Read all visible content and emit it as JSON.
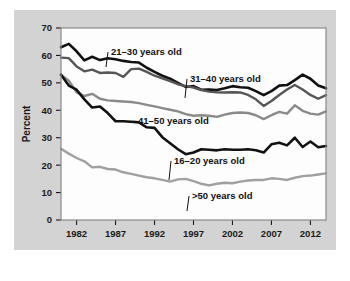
{
  "chart_data": {
    "type": "line",
    "title": "",
    "xlabel": "",
    "ylabel": "Percent",
    "xlim": [
      1980,
      2014
    ],
    "ylim": [
      0,
      70
    ],
    "ytick_values": [
      0,
      10,
      20,
      30,
      40,
      50,
      60,
      70
    ],
    "ytick_labels": [
      "0",
      "10",
      "20",
      "30",
      "40",
      "50",
      "60",
      "70"
    ],
    "xtick_values": [
      1982,
      1987,
      1992,
      1997,
      2002,
      2007,
      2012
    ],
    "xtick_labels": [
      "1982",
      "1987",
      "1992",
      "1997",
      "2002",
      "2007",
      "2012"
    ],
    "grid": false,
    "legend_position": "inline-annotations",
    "x": [
      1980,
      1981,
      1982,
      1983,
      1984,
      1985,
      1986,
      1987,
      1988,
      1989,
      1990,
      1991,
      1992,
      1993,
      1994,
      1995,
      1996,
      1997,
      1998,
      1999,
      2000,
      2001,
      2002,
      2003,
      2004,
      2005,
      2006,
      2007,
      2008,
      2009,
      2010,
      2011,
      2012,
      2013,
      2014
    ],
    "series": [
      {
        "name": "21-30 years old",
        "label": "21–30 years old",
        "color": "#111111",
        "width": 2.6,
        "values": [
          63.0,
          64.2,
          61.5,
          58.2,
          59.5,
          58.3,
          59.0,
          58.6,
          58.0,
          57.6,
          57.4,
          55.5,
          54.0,
          52.6,
          51.5,
          50.0,
          48.5,
          48.8,
          47.5,
          47.6,
          47.4,
          48.0,
          48.8,
          48.4,
          48.2,
          47.0,
          45.5,
          47.0,
          49.0,
          49.2,
          51.0,
          53.0,
          51.5,
          49.0,
          48.0
        ]
      },
      {
        "name": "31-40 years old",
        "label": "31–40 years old",
        "color": "#565656",
        "width": 2.4,
        "values": [
          59.2,
          59.0,
          56.0,
          54.2,
          54.8,
          53.6,
          53.8,
          53.6,
          52.2,
          55.0,
          55.2,
          54.0,
          52.6,
          51.6,
          50.6,
          49.5,
          48.8,
          48.3,
          47.4,
          46.8,
          46.6,
          46.5,
          46.6,
          46.5,
          45.6,
          44.0,
          41.6,
          43.4,
          45.6,
          47.6,
          49.2,
          47.6,
          45.6,
          44.2,
          45.5
        ]
      },
      {
        "name": "41-50 years old",
        "label": "41–50 years old",
        "color": "#8a8a8a",
        "width": 2.4,
        "values": [
          53.0,
          50.8,
          46.5,
          45.2,
          46.0,
          44.2,
          43.6,
          43.4,
          43.2,
          43.0,
          42.6,
          42.0,
          41.4,
          40.8,
          40.2,
          39.6,
          38.6,
          38.0,
          38.2,
          38.0,
          37.6,
          38.4,
          39.0,
          39.2,
          39.0,
          38.2,
          36.8,
          38.2,
          39.4,
          38.8,
          41.8,
          39.8,
          38.8,
          38.4,
          39.6
        ]
      },
      {
        "name": "16-20 years old",
        "label": "16–20 years old",
        "color": "#111111",
        "width": 2.6,
        "values": [
          53.0,
          49.0,
          47.5,
          44.0,
          41.0,
          41.4,
          39.0,
          36.0,
          36.0,
          35.8,
          35.6,
          33.8,
          33.6,
          30.2,
          28.0,
          25.8,
          24.0,
          24.6,
          25.8,
          25.6,
          25.4,
          25.8,
          25.6,
          25.6,
          25.8,
          25.4,
          24.6,
          27.6,
          28.2,
          27.2,
          30.0,
          26.6,
          28.6,
          26.5,
          27.0
        ]
      },
      {
        "name": ">50 years old",
        "label": ">50 years old",
        "color": "#a0a0a0",
        "width": 2.4,
        "values": [
          26.0,
          24.2,
          22.6,
          21.4,
          19.2,
          19.4,
          18.6,
          18.4,
          17.4,
          16.8,
          16.2,
          15.6,
          15.2,
          14.6,
          14.0,
          14.8,
          15.0,
          14.2,
          13.2,
          12.6,
          13.2,
          13.6,
          13.4,
          14.0,
          14.4,
          14.6,
          14.6,
          15.2,
          15.0,
          14.6,
          15.4,
          16.0,
          16.2,
          16.6,
          17.0
        ]
      }
    ],
    "annotations": [
      {
        "text": "21–30 years old",
        "x": 97,
        "y": 45
      },
      {
        "text": "31–40 years old",
        "x": 176,
        "y": 72
      },
      {
        "text": "41–50 years old",
        "x": 124,
        "y": 114
      },
      {
        "text": "16–20 years old",
        "x": 160,
        "y": 154
      },
      {
        "text": ">50 years old",
        "x": 178,
        "y": 189
      }
    ],
    "colors": {
      "background": "#d3d3d3",
      "plot_background": "#fdfdfd",
      "frame": "#8a8a8a",
      "text": "#1a1a1a"
    }
  }
}
